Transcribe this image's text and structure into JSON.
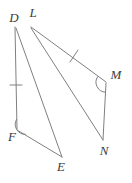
{
  "figure": {
    "type": "geometry-diagram",
    "stroke_color": "#808080",
    "label_color": "#3c3c3c",
    "background_color": "#ffffff",
    "stroke_width": 1,
    "width": 132,
    "height": 183
  },
  "vertices": [
    {
      "id": "D",
      "label": "D",
      "x": 15,
      "y": 27,
      "label_x": 14,
      "label_y": 19
    },
    {
      "id": "L",
      "label": "L",
      "x": 31,
      "y": 26,
      "label_x": 33,
      "label_y": 14
    },
    {
      "id": "M",
      "label": "M",
      "x": 106,
      "y": 82,
      "label_x": 116,
      "label_y": 76
    },
    {
      "id": "N",
      "label": "N",
      "x": 103,
      "y": 140,
      "label_x": 104,
      "label_y": 152
    },
    {
      "id": "F",
      "label": "F",
      "x": 17,
      "y": 129,
      "label_x": 12,
      "label_y": 138
    },
    {
      "id": "E",
      "label": "E",
      "x": 62,
      "y": 157,
      "label_x": 61,
      "label_y": 168
    }
  ],
  "segments": [
    {
      "id": "DF",
      "from": "D",
      "to": "F",
      "x1": 15,
      "y1": 27,
      "x2": 17,
      "y2": 129,
      "ticks": 1
    },
    {
      "id": "DE",
      "from": "D",
      "to": "E",
      "x1": 16,
      "y1": 28,
      "x2": 62,
      "y2": 157,
      "ticks": 0
    },
    {
      "id": "FE",
      "from": "F",
      "to": "E",
      "x1": 17,
      "y1": 130,
      "x2": 62,
      "y2": 157,
      "ticks": 0
    },
    {
      "id": "LM",
      "from": "L",
      "to": "M",
      "x1": 31,
      "y1": 27,
      "x2": 106,
      "y2": 82,
      "ticks": 1
    },
    {
      "id": "LN",
      "from": "L",
      "to": "N",
      "x1": 31,
      "y1": 28,
      "x2": 103,
      "y2": 140,
      "ticks": 0
    },
    {
      "id": "MN",
      "from": "M",
      "to": "N",
      "x1": 106,
      "y1": 83,
      "x2": 103,
      "y2": 140,
      "ticks": 0
    }
  ],
  "tick_marks": [
    {
      "id": "tick-DF",
      "on_segment": "DF",
      "x": 16,
      "y": 85,
      "angle_deg": 1
    },
    {
      "id": "tick-LM",
      "on_segment": "LM",
      "x": 74,
      "y": 56,
      "angle_deg": 36
    }
  ],
  "angle_marks": [
    {
      "id": "angle-F",
      "at_vertex": "F",
      "kind": "arc",
      "x": 17,
      "y": 129,
      "radius": 9
    },
    {
      "id": "angle-M",
      "at_vertex": "M",
      "kind": "arc",
      "x": 106,
      "y": 82,
      "radius": 9
    }
  ],
  "shapes": [
    {
      "id": "triangle-DFE",
      "vertices": [
        "D",
        "F",
        "E"
      ]
    },
    {
      "id": "triangle-LMN",
      "vertices": [
        "L",
        "M",
        "N"
      ]
    }
  ]
}
